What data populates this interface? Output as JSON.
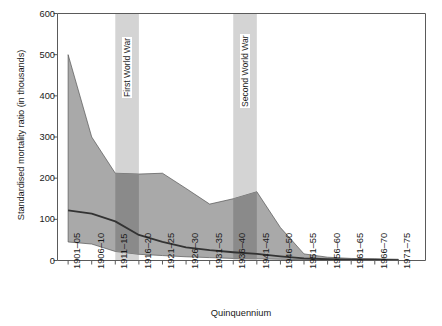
{
  "chart_data": {
    "type": "area",
    "title": "",
    "xlabel": "Quinquennium",
    "ylabel": "Standardised mortality ratio (in thousands)",
    "ylim": [
      0,
      600
    ],
    "yticks": [
      0,
      100,
      200,
      300,
      400,
      500,
      600
    ],
    "grid": false,
    "legend": "none",
    "categories": [
      "1901–05",
      "1906–10",
      "1911–15",
      "1916–20",
      "1921–25",
      "1926–30",
      "1931–35",
      "1936–40",
      "1941–45",
      "1946–50",
      "1951–55",
      "1956–60",
      "1961–65",
      "1966–70",
      "1971–75"
    ],
    "series": [
      {
        "name": "Upper bound",
        "values": [
          500,
          300,
          212,
          210,
          212,
          175,
          137,
          150,
          167,
          80,
          16,
          8,
          5,
          4,
          3
        ]
      },
      {
        "name": "Median",
        "values": [
          122,
          114,
          95,
          62,
          45,
          32,
          25,
          20,
          16,
          10,
          5,
          3,
          2,
          2,
          1
        ]
      },
      {
        "name": "Lower bound",
        "values": [
          45,
          40,
          22,
          15,
          12,
          9,
          7,
          5,
          4,
          3,
          2,
          1,
          1,
          1,
          0
        ]
      }
    ],
    "annotations": [
      {
        "label": "First World War",
        "from": "1911–15",
        "to": "1916–20"
      },
      {
        "label": "Second World War",
        "from": "1936–40",
        "to": "1941–45"
      }
    ],
    "colors": {
      "band_fill": "#a9a9a9",
      "band_fill_war_overlap": "#8a8a8a",
      "war_band": "#d4d4d4",
      "median_line": "#333333",
      "axis": "#5a5a5a",
      "text": "#1a1a1a",
      "background": "#ffffff"
    }
  }
}
